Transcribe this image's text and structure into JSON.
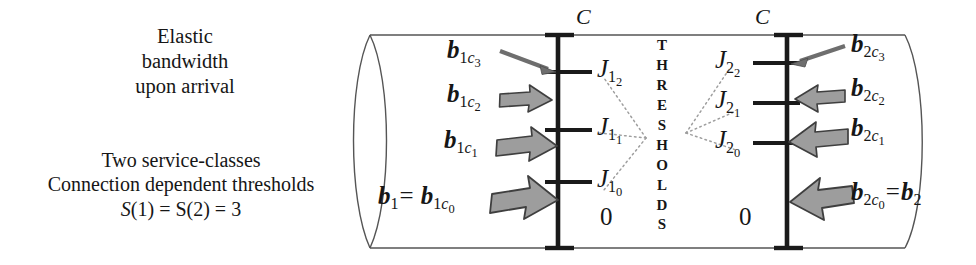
{
  "caption": {
    "top_lines": [
      "Elastic",
      "bandwidth",
      "upon arrival"
    ],
    "bottom_line1": "Two service-classes",
    "bottom_line2": "Connection dependent thresholds",
    "bottom_line3_s": "S",
    "bottom_line3_rest": "(1) = S(2) = 3"
  },
  "thresholds_word": "THRESHOLDS",
  "capacity_label_left": "C",
  "capacity_label_right": "C",
  "zero_left": "0",
  "zero_right": "0",
  "left_axis": {
    "ticks": [
      {
        "label_j": "J",
        "sub1": "1",
        "sub2": "2"
      },
      {
        "label_j": "J",
        "sub1": "1",
        "sub2": "1"
      },
      {
        "label_j": "J",
        "sub1": "1",
        "sub2": "0"
      }
    ],
    "arrow_labels": [
      {
        "b": "b",
        "sub_class": "1",
        "sub_c": "c",
        "sub_idx": "3",
        "prefix": ""
      },
      {
        "b": "b",
        "sub_class": "1",
        "sub_c": "c",
        "sub_idx": "2",
        "prefix": ""
      },
      {
        "b": "b",
        "sub_class": "1",
        "sub_c": "c",
        "sub_idx": "1",
        "prefix": ""
      },
      {
        "b": "b",
        "sub_class": "1",
        "sub_c": "c",
        "sub_idx": "0",
        "prefix": "b1eq"
      }
    ],
    "prefix_b": "b",
    "prefix_sub": "1",
    "prefix_eq": "="
  },
  "right_axis": {
    "ticks": [
      {
        "label_j": "J",
        "sub1": "2",
        "sub2": "2"
      },
      {
        "label_j": "J",
        "sub1": "2",
        "sub2": "1"
      },
      {
        "label_j": "J",
        "sub1": "2",
        "sub2": "0"
      }
    ],
    "arrow_labels": [
      {
        "b": "b",
        "sub_class": "2",
        "sub_c": "c",
        "sub_idx": "3",
        "suffix": ""
      },
      {
        "b": "b",
        "sub_class": "2",
        "sub_c": "c",
        "sub_idx": "2",
        "suffix": ""
      },
      {
        "b": "b",
        "sub_class": "2",
        "sub_c": "c",
        "sub_idx": "1",
        "suffix": ""
      },
      {
        "b": "b",
        "sub_class": "2",
        "sub_c": "c",
        "sub_idx": "0",
        "suffix": "eqb2"
      }
    ],
    "suffix_eq": "=",
    "suffix_b": "b",
    "suffix_sub": "2"
  },
  "colors": {
    "stroke": "#222222",
    "arrow_fill": "#9d9d9d",
    "arrow_stroke": "#3a3a3a",
    "cylinder_stroke": "#555555",
    "dotted": "#9a9a9a",
    "text": "#161616"
  }
}
